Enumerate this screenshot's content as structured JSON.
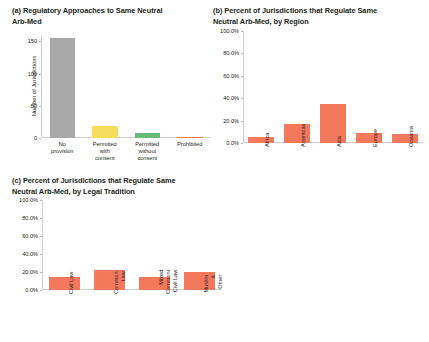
{
  "figure": {
    "background": "#ffffff",
    "text_color": "#231f20",
    "axis_color": "#cfcfcf"
  },
  "panels": [
    {
      "id": "a",
      "title": "(a) Regulatory Approaches to Same Neutral\nArb-Med",
      "ylabel": "Number of Jurisdictions"
    },
    {
      "id": "b",
      "title": "(b) Percent of Jurisdictions that Regulate Same\nNeutral Arb-Med, by Region",
      "ylabel": ""
    },
    {
      "id": "c",
      "title": "(c) Percent of Jurisdictions that Regulate Same\nNeutral Arb-Med, by Legal Tradition",
      "ylabel": ""
    }
  ],
  "chart_data": [
    {
      "type": "bar",
      "panel": "a",
      "title": "(a) Regulatory Approaches to Same Neutral Arb-Med",
      "xlabel": "",
      "ylabel": "Number of Jurisdictions",
      "ylim": [
        0,
        160
      ],
      "yticks": [
        0,
        50,
        100,
        150
      ],
      "ytick_labels": [
        "0",
        "50",
        "100",
        "150"
      ],
      "grid": false,
      "legend": "none",
      "categories": [
        "No\nprovision",
        "Permitted\nwith\nconsent",
        "Permitted\nwithout\nconsent",
        "Prohibited"
      ],
      "category_labels_plain": [
        "No provision",
        "Permitted with consent",
        "Permitted without consent",
        "Prohibited"
      ],
      "values": [
        155,
        18,
        8,
        1
      ],
      "colors": [
        "#a8a8a8",
        "#f5dc5a",
        "#66bb77",
        "#f4785c"
      ]
    },
    {
      "type": "bar",
      "panel": "b",
      "title": "(b) Percent of Jurisdictions that Regulate Same Neutral Arb-Med, by Region",
      "xlabel": "",
      "ylabel": "",
      "ylim": [
        0,
        100
      ],
      "yticks": [
        0,
        20,
        40,
        60,
        80,
        100
      ],
      "ytick_labels": [
        "0.0%",
        "20.0%",
        "40.0%",
        "60.0%",
        "80.0%",
        "100.0%"
      ],
      "grid": false,
      "legend": "none",
      "categories": [
        "Africa",
        "Americas",
        "Asia",
        "Europe",
        "Oceania"
      ],
      "values": [
        5.0,
        17.0,
        35.0,
        9.0,
        8.0
      ],
      "value_labels": [
        "5.0%",
        "17.0%",
        "35.0%",
        "9.0%",
        "8.0%"
      ],
      "colors": [
        "#f4785c",
        "#f4785c",
        "#f4785c",
        "#f4785c",
        "#f4785c"
      ]
    },
    {
      "type": "bar",
      "panel": "c",
      "title": "(c) Percent of Jurisdictions that Regulate Same Neutral Arb-Med, by Legal Tradition",
      "xlabel": "",
      "ylabel": "",
      "ylim": [
        0,
        100
      ],
      "yticks": [
        0,
        20,
        40,
        60,
        80,
        100
      ],
      "ytick_labels": [
        "0.0%",
        "20.0%",
        "40.0%",
        "60.0%",
        "80.0%",
        "100.0%"
      ],
      "grid": false,
      "legend": "none",
      "categories": [
        "Civil Law",
        "Common\nLaw",
        "Mixed\nCommon/\nCivil Law",
        "Muslim &\nOther"
      ],
      "category_labels_plain": [
        "Civil Law",
        "Common Law",
        "Mixed Common/ Civil Law",
        "Muslim & Other"
      ],
      "values": [
        14.0,
        22.0,
        14.0,
        20.0
      ],
      "value_labels": [
        "14.0%",
        "22.0%",
        "14.0%",
        "20.0%"
      ],
      "colors": [
        "#f4785c",
        "#f4785c",
        "#f4785c",
        "#f4785c"
      ]
    }
  ]
}
